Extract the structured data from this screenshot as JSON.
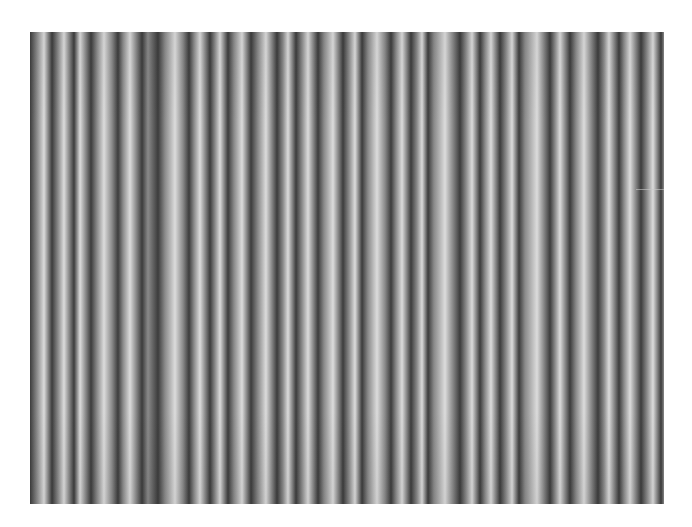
{
  "image": {
    "description": "Grayscale photograph of closely spaced vertical stripes (fabric / interference pattern)",
    "left": 30,
    "top": 32,
    "width": 634,
    "height": 472,
    "background": "#ffffff",
    "dark_color": "#3c3c3c",
    "mid_color": "#8a8a8a",
    "light_color": "#dcdcdc",
    "artifact_y": 157,
    "bands": [
      {
        "x": 30,
        "tone": "dark"
      },
      {
        "x": 37,
        "tone": "mid"
      },
      {
        "x": 44,
        "tone": "light"
      },
      {
        "x": 52,
        "tone": "dark"
      },
      {
        "x": 58,
        "tone": "mid"
      },
      {
        "x": 64,
        "tone": "light"
      },
      {
        "x": 74,
        "tone": "dark"
      },
      {
        "x": 80,
        "tone": "light"
      },
      {
        "x": 91,
        "tone": "dark"
      },
      {
        "x": 97,
        "tone": "mid"
      },
      {
        "x": 104,
        "tone": "light"
      },
      {
        "x": 112,
        "tone": "mid"
      },
      {
        "x": 118,
        "tone": "dark"
      },
      {
        "x": 123,
        "tone": "mid"
      },
      {
        "x": 130,
        "tone": "light"
      },
      {
        "x": 142,
        "tone": "dark"
      },
      {
        "x": 148,
        "tone": "mid"
      },
      {
        "x": 158,
        "tone": "dark"
      },
      {
        "x": 165,
        "tone": "mid"
      },
      {
        "x": 175,
        "tone": "light"
      },
      {
        "x": 183,
        "tone": "mid"
      },
      {
        "x": 189,
        "tone": "dark"
      },
      {
        "x": 194,
        "tone": "mid"
      },
      {
        "x": 200,
        "tone": "light"
      },
      {
        "x": 210,
        "tone": "dark"
      },
      {
        "x": 215,
        "tone": "mid"
      },
      {
        "x": 220,
        "tone": "light"
      },
      {
        "x": 228,
        "tone": "dark"
      },
      {
        "x": 234,
        "tone": "mid"
      },
      {
        "x": 242,
        "tone": "light"
      },
      {
        "x": 251,
        "tone": "dark"
      },
      {
        "x": 258,
        "tone": "mid"
      },
      {
        "x": 266,
        "tone": "light"
      },
      {
        "x": 277,
        "tone": "dark"
      },
      {
        "x": 283,
        "tone": "mid"
      },
      {
        "x": 288,
        "tone": "light"
      },
      {
        "x": 296,
        "tone": "dark"
      },
      {
        "x": 302,
        "tone": "mid"
      },
      {
        "x": 308,
        "tone": "light"
      },
      {
        "x": 318,
        "tone": "dark"
      },
      {
        "x": 324,
        "tone": "mid"
      },
      {
        "x": 333,
        "tone": "light"
      },
      {
        "x": 343,
        "tone": "dark"
      },
      {
        "x": 349,
        "tone": "mid"
      },
      {
        "x": 355,
        "tone": "light"
      },
      {
        "x": 362,
        "tone": "dark"
      },
      {
        "x": 368,
        "tone": "mid"
      },
      {
        "x": 377,
        "tone": "light"
      },
      {
        "x": 385,
        "tone": "mid"
      },
      {
        "x": 391,
        "tone": "dark"
      },
      {
        "x": 396,
        "tone": "mid"
      },
      {
        "x": 402,
        "tone": "light"
      },
      {
        "x": 411,
        "tone": "dark"
      },
      {
        "x": 417,
        "tone": "mid"
      },
      {
        "x": 422,
        "tone": "light"
      },
      {
        "x": 428,
        "tone": "dark"
      },
      {
        "x": 434,
        "tone": "mid"
      },
      {
        "x": 445,
        "tone": "light"
      },
      {
        "x": 460,
        "tone": "dark"
      },
      {
        "x": 466,
        "tone": "mid"
      },
      {
        "x": 472,
        "tone": "light"
      },
      {
        "x": 480,
        "tone": "dark"
      },
      {
        "x": 485,
        "tone": "mid"
      },
      {
        "x": 491,
        "tone": "light"
      },
      {
        "x": 500,
        "tone": "dark"
      },
      {
        "x": 506,
        "tone": "mid"
      },
      {
        "x": 512,
        "tone": "light"
      },
      {
        "x": 519,
        "tone": "dark"
      },
      {
        "x": 525,
        "tone": "mid"
      },
      {
        "x": 537,
        "tone": "light"
      },
      {
        "x": 550,
        "tone": "dark"
      },
      {
        "x": 555,
        "tone": "mid"
      },
      {
        "x": 560,
        "tone": "light"
      },
      {
        "x": 570,
        "tone": "dark"
      },
      {
        "x": 576,
        "tone": "mid"
      },
      {
        "x": 584,
        "tone": "light"
      },
      {
        "x": 598,
        "tone": "dark"
      },
      {
        "x": 604,
        "tone": "mid"
      },
      {
        "x": 609,
        "tone": "light"
      },
      {
        "x": 619,
        "tone": "dark"
      },
      {
        "x": 624,
        "tone": "mid"
      },
      {
        "x": 630,
        "tone": "light"
      },
      {
        "x": 641,
        "tone": "dark"
      },
      {
        "x": 647,
        "tone": "mid"
      },
      {
        "x": 653,
        "tone": "light"
      },
      {
        "x": 661,
        "tone": "dark"
      },
      {
        "x": 664,
        "tone": "mid"
      }
    ]
  }
}
